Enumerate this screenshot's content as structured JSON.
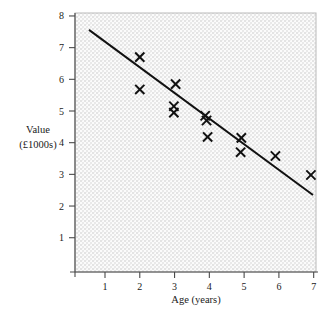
{
  "chart_data": {
    "type": "scatter",
    "title": "",
    "xlabel": "Age (years)",
    "ylabel": "Value (£1000s)",
    "ylabel_lines": [
      "Value",
      "(£1000s)"
    ],
    "xlim": [
      0.35,
      7.4
    ],
    "ylim": [
      0,
      8.25
    ],
    "xticks": [
      1,
      2,
      3,
      4,
      5,
      6,
      7
    ],
    "yticks": [
      1,
      2,
      3,
      4,
      5,
      6,
      7,
      8
    ],
    "xtick_labels": [
      "1",
      "2",
      "3",
      "4",
      "5",
      "6",
      "7"
    ],
    "ytick_labels": [
      "1",
      "2",
      "3",
      "4",
      "5",
      "6",
      "7",
      "8"
    ],
    "grid": false,
    "legend": "none",
    "background": "light-grey-hatched",
    "marker_style": "x-cross",
    "points": [
      {
        "x": 2.0,
        "y": 6.7
      },
      {
        "x": 2.0,
        "y": 5.68
      },
      {
        "x": 3.03,
        "y": 5.85
      },
      {
        "x": 2.98,
        "y": 5.15
      },
      {
        "x": 2.98,
        "y": 4.95
      },
      {
        "x": 3.88,
        "y": 4.85
      },
      {
        "x": 3.92,
        "y": 4.7
      },
      {
        "x": 3.95,
        "y": 4.18
      },
      {
        "x": 4.92,
        "y": 4.15
      },
      {
        "x": 4.9,
        "y": 3.7
      },
      {
        "x": 5.9,
        "y": 3.58
      },
      {
        "x": 6.92,
        "y": 2.98
      }
    ],
    "trend_line": {
      "type": "line-of-best-fit",
      "x_start": 0.54,
      "y_start": 7.56,
      "x_end": 6.98,
      "y_end": 2.35
    },
    "colors": {
      "marker": "#111111",
      "trend": "#111111",
      "axis": "#4a4a4a",
      "text": "#1a1a1a",
      "plot_background": "#ededed"
    }
  }
}
